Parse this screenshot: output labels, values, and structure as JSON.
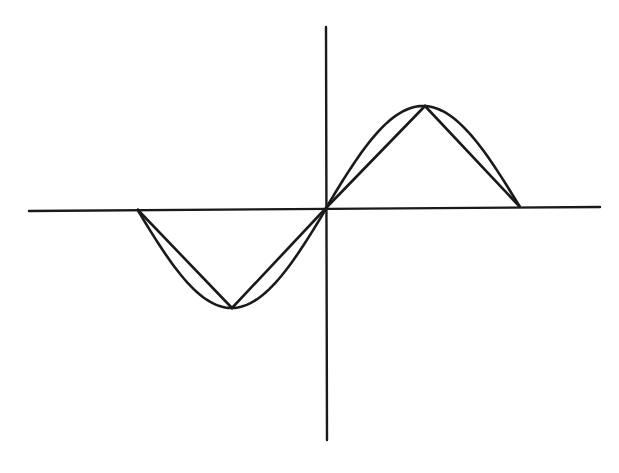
{
  "figure": {
    "colors": {
      "background": "#ffffff",
      "stroke": "#1a1a1a"
    },
    "axes": {
      "x_axis": {
        "x1": 29,
        "y1": 211,
        "x2": 600,
        "y2": 207
      },
      "y_axis": {
        "x1": 326,
        "y1": 27,
        "x2": 327,
        "y2": 440
      }
    },
    "curves": {
      "sine": {
        "start_x": 137,
        "end_x": 520,
        "origin_x": 326,
        "baseline_y": 209,
        "amplitude_px": 101,
        "min_point": [
          232,
          308
        ],
        "max_point": [
          425,
          106
        ]
      },
      "triangle": {
        "points": [
          [
            137,
            209
          ],
          [
            232,
            308
          ],
          [
            326,
            208
          ],
          [
            425,
            106
          ],
          [
            520,
            207
          ]
        ]
      }
    }
  },
  "chart_data": {
    "type": "line",
    "title": "",
    "xlabel": "",
    "ylabel": "",
    "series": [
      {
        "name": "sine",
        "x": [
          -3.1416,
          -1.5708,
          0,
          1.5708,
          3.1416
        ],
        "values": [
          0,
          -1,
          0,
          1,
          0
        ],
        "smooth": true
      },
      {
        "name": "triangle approximation",
        "x": [
          -3.1416,
          -1.5708,
          0,
          1.5708,
          3.1416
        ],
        "values": [
          0,
          -1,
          0,
          1,
          0
        ],
        "smooth": false
      }
    ],
    "grid": false,
    "legend": "none"
  }
}
